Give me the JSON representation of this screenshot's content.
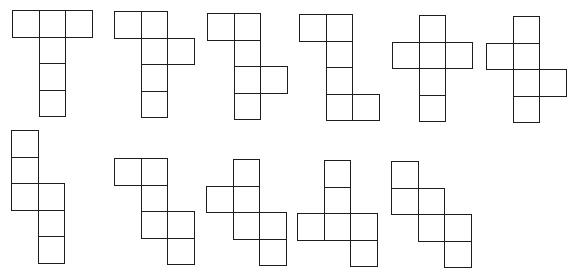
{
  "colors": {
    "stroke": "#1e1e1e",
    "background": "#ffffff"
  },
  "cell_size": 26.5,
  "nets": [
    {
      "id": "net-1",
      "origin": [
        12,
        10
      ],
      "cells": [
        [
          0,
          0
        ],
        [
          1,
          0
        ],
        [
          2,
          0
        ],
        [
          1,
          1
        ],
        [
          1,
          2
        ],
        [
          1,
          3
        ]
      ]
    },
    {
      "id": "net-2",
      "origin": [
        114,
        11
      ],
      "cells": [
        [
          0,
          0
        ],
        [
          1,
          0
        ],
        [
          1,
          1
        ],
        [
          2,
          1
        ],
        [
          1,
          2
        ],
        [
          1,
          3
        ]
      ]
    },
    {
      "id": "net-3",
      "origin": [
        207,
        13
      ],
      "cells": [
        [
          0,
          0
        ],
        [
          1,
          0
        ],
        [
          1,
          1
        ],
        [
          1,
          2
        ],
        [
          2,
          2
        ],
        [
          1,
          3
        ]
      ]
    },
    {
      "id": "net-4",
      "origin": [
        299,
        14
      ],
      "cells": [
        [
          0,
          0
        ],
        [
          1,
          0
        ],
        [
          1,
          1
        ],
        [
          1,
          2
        ],
        [
          1,
          3
        ],
        [
          2,
          3
        ]
      ]
    },
    {
      "id": "net-5",
      "origin": [
        392,
        15
      ],
      "cells": [
        [
          1,
          0
        ],
        [
          0,
          1
        ],
        [
          1,
          1
        ],
        [
          2,
          1
        ],
        [
          1,
          2
        ],
        [
          1,
          3
        ]
      ]
    },
    {
      "id": "net-6",
      "origin": [
        486,
        16
      ],
      "cells": [
        [
          1,
          0
        ],
        [
          0,
          1
        ],
        [
          1,
          1
        ],
        [
          1,
          2
        ],
        [
          2,
          2
        ],
        [
          1,
          3
        ]
      ]
    },
    {
      "id": "net-7",
      "origin": [
        11,
        130
      ],
      "cells": [
        [
          0,
          0
        ],
        [
          0,
          1
        ],
        [
          0,
          2
        ],
        [
          1,
          2
        ],
        [
          1,
          3
        ],
        [
          1,
          4
        ]
      ]
    },
    {
      "id": "net-8",
      "origin": [
        114,
        158
      ],
      "cells": [
        [
          0,
          0
        ],
        [
          1,
          0
        ],
        [
          1,
          1
        ],
        [
          1,
          2
        ],
        [
          2,
          2
        ],
        [
          2,
          3
        ]
      ]
    },
    {
      "id": "net-9",
      "origin": [
        206,
        159
      ],
      "cells": [
        [
          1,
          0
        ],
        [
          0,
          1
        ],
        [
          1,
          1
        ],
        [
          1,
          2
        ],
        [
          2,
          2
        ],
        [
          2,
          3
        ]
      ]
    },
    {
      "id": "net-10",
      "origin": [
        297,
        160
      ],
      "cells": [
        [
          1,
          0
        ],
        [
          1,
          1
        ],
        [
          0,
          2
        ],
        [
          1,
          2
        ],
        [
          2,
          2
        ],
        [
          2,
          3
        ]
      ]
    },
    {
      "id": "net-11",
      "origin": [
        391,
        161
      ],
      "cells": [
        [
          0,
          0
        ],
        [
          0,
          1
        ],
        [
          1,
          1
        ],
        [
          1,
          2
        ],
        [
          2,
          2
        ],
        [
          2,
          3
        ]
      ]
    }
  ]
}
